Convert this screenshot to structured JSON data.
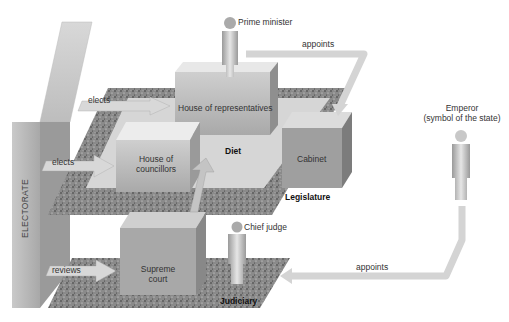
{
  "diagram": {
    "nodes": {
      "electorate": "ELECTORATE",
      "prime_minister": "Prime minister",
      "house_of_representatives": "House of representatives",
      "house_of_councillors_line1": "House of",
      "house_of_councillors_line2": "councillors",
      "diet": "Diet",
      "cabinet": "Cabinet",
      "legislature": "Legislature",
      "emperor_line1": "Emperor",
      "emperor_line2": "(symbol of the state)",
      "chief_judge": "Chief judge",
      "supreme_court_line1": "Supreme",
      "supreme_court_line2": "court",
      "judiciary": "Judiciary"
    },
    "edges": {
      "elects_representatives": "elects",
      "elects_councillors": "elects",
      "reviews": "reviews",
      "pm_appoints_cabinet": "appoints",
      "emperor_appoints_chief_judge": "appoints"
    },
    "colors": {
      "platform_speckle": "#7a7a7a",
      "block_light": "#e2e2e2",
      "block_mid": "#b8b8b8",
      "block_dark": "#8e8e8e",
      "arrow_fill": "#d8d8d8",
      "figure": "#bfbfbf"
    }
  }
}
